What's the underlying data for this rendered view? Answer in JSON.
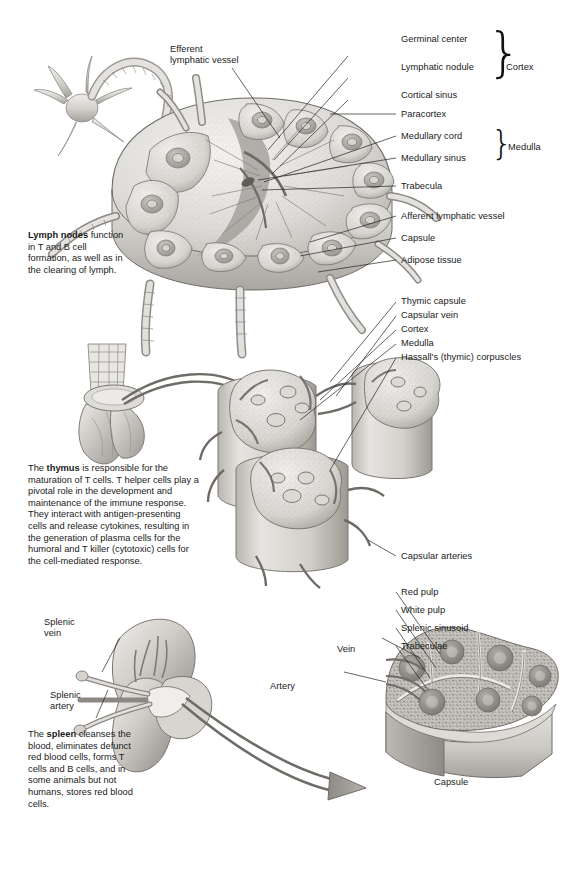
{
  "figure": {
    "background": "#ffffff",
    "title_implicit": "Lymphoid organs: lymph node, thymus, and spleen"
  },
  "lymph_node": {
    "caption_bold": "Lymph nodes",
    "caption_rest": " function in T and B cell formation, as well as in the clearing of lymph.",
    "labels_left": [
      {
        "id": "efferent-lymphatic-vessel",
        "line1": "Efferent",
        "line2": "lymphatic vessel"
      }
    ],
    "labels_right": [
      {
        "id": "germinal-center",
        "text": "Germinal center"
      },
      {
        "id": "lymphatic-nodule",
        "text": "Lymphatic nodule"
      },
      {
        "id": "cortical-sinus",
        "text": "Cortical sinus"
      },
      {
        "id": "paracortex",
        "text": "Paracortex"
      },
      {
        "id": "medullary-cord",
        "text": "Medullary cord"
      },
      {
        "id": "medullary-sinus",
        "text": "Medullary sinus"
      },
      {
        "id": "trabecula",
        "text": "Trabecula"
      },
      {
        "id": "afferent-lymphatic-vessel",
        "text": "Afferent lymphatic vessel"
      },
      {
        "id": "capsule",
        "text": "Capsule"
      },
      {
        "id": "adipose-tissue",
        "text": "Adipose tissue"
      }
    ],
    "groups": [
      {
        "id": "cortex",
        "text": "Cortex"
      },
      {
        "id": "medulla",
        "text": "Medulla"
      }
    ]
  },
  "thymus": {
    "paragraph_pre": "The ",
    "paragraph_bold": "thymus",
    "paragraph_post": " is responsible for the maturation of T cells. T helper cells play a pivotal role in the development and maintenance of the immune response. They interact with antigen-presenting cells and release cytokines, resulting in the generation of plasma cells for the humoral and T killer (cytotoxic) cells for the cell-mediated response.",
    "labels": [
      {
        "id": "thymic-capsule",
        "text": "Thymic capsule"
      },
      {
        "id": "capsular-vein",
        "text": "Capsular vein"
      },
      {
        "id": "thymus-cortex",
        "text": "Cortex"
      },
      {
        "id": "thymus-medulla",
        "text": "Medulla"
      },
      {
        "id": "hassalls-corpuscles",
        "text": "Hassall's (thymic) corpuscles"
      },
      {
        "id": "capsular-arteries",
        "text": "Capsular arteries"
      }
    ]
  },
  "spleen": {
    "paragraph_pre": "The ",
    "paragraph_bold": "spleen",
    "paragraph_post": " cleanses the blood, eliminates defunct red blood cells, forms T cells and B cells, and in some animals but not humans, stores red blood cells.",
    "organ_labels": [
      {
        "id": "splenic-vein",
        "line1": "Splenic",
        "line2": "vein"
      },
      {
        "id": "splenic-artery",
        "line1": "Splenic",
        "line2": "artery"
      }
    ],
    "section_labels": [
      {
        "id": "spleen-vein",
        "text": "Vein"
      },
      {
        "id": "spleen-artery",
        "text": "Artery"
      },
      {
        "id": "red-pulp",
        "text": "Red pulp"
      },
      {
        "id": "white-pulp",
        "text": "White pulp"
      },
      {
        "id": "splenic-sinusoid",
        "text": "Splenic sinusoid"
      },
      {
        "id": "trabeculae",
        "text": "Trabeculae"
      },
      {
        "id": "spleen-capsule",
        "text": "Capsule"
      }
    ]
  }
}
